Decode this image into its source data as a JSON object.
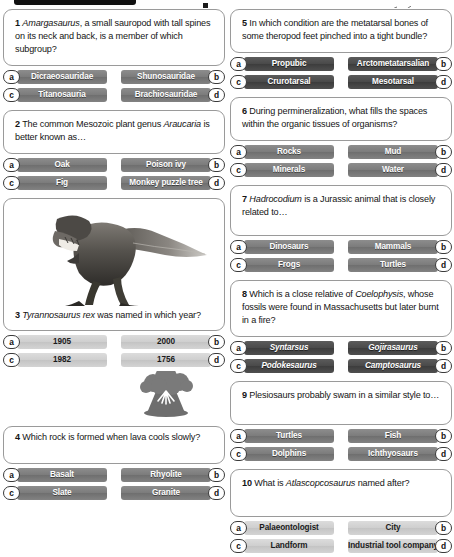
{
  "page": {
    "columns": 2
  },
  "header": {
    "bar_icon": "black-tab-bar",
    "dot_icon": "square-dot",
    "swoosh_icon": "swoosh-mark"
  },
  "shades": {
    "dark": "#4a4a4a",
    "mid": "#7c7c7c",
    "light": "#cfcfcf",
    "card_border": "#9a9a9a",
    "text": "#141414"
  },
  "letters": [
    "a",
    "b",
    "c",
    "d"
  ],
  "questions": [
    {
      "number": "1",
      "column": "left",
      "shade": "mid",
      "italic_answers": false,
      "text_parts": [
        {
          "text": "Amargasaurus",
          "italic": true
        },
        {
          "text": ", a small sauropod with tall spines on its neck and back, is a member of which subgroup?",
          "italic": false
        }
      ],
      "answers": [
        "Dicraeosauridae",
        "Shunosauridae",
        "Titanosauria",
        "Brachiosauridae"
      ]
    },
    {
      "number": "2",
      "column": "left",
      "shade": "mid",
      "italic_answers": false,
      "text_parts": [
        {
          "text": "The common Mesozoic plant genus ",
          "italic": false
        },
        {
          "text": "Araucaria",
          "italic": true
        },
        {
          "text": " is better known as…",
          "italic": false
        }
      ],
      "answers": [
        "Oak",
        "Poison ivy",
        "Fig",
        "Monkey puzzle tree"
      ]
    },
    {
      "number": "3",
      "column": "left",
      "shade": "light",
      "italic_answers": false,
      "image": "tyrannosaurus-rex-photo",
      "text_parts": [
        {
          "text": "Tyrannosaurus rex",
          "italic": true
        },
        {
          "text": " was named in which year?",
          "italic": false
        }
      ],
      "answers": [
        "1905",
        "2000",
        "1982",
        "1756"
      ]
    },
    {
      "number": "4",
      "column": "left",
      "shade": "mid",
      "italic_answers": false,
      "image": "erupting-volcano-illustration",
      "text_parts": [
        {
          "text": "Which rock is formed when lava cools slowly?",
          "italic": false
        }
      ],
      "answers": [
        "Basalt",
        "Rhyolite",
        "Slate",
        "Granite"
      ]
    },
    {
      "number": "5",
      "column": "right",
      "shade": "dark",
      "italic_answers": false,
      "text_parts": [
        {
          "text": "In which condition are the metatarsal bones of some theropod feet pinched into a tight bundle?",
          "italic": false
        }
      ],
      "answers": [
        "Propubic",
        "Arctometatarsalian",
        "Crurotarsal",
        "Mesotarsal"
      ]
    },
    {
      "number": "6",
      "column": "right",
      "shade": "mid",
      "italic_answers": false,
      "text_parts": [
        {
          "text": "During permineralization, what fills the spaces within the organic tissues of organisms?",
          "italic": false
        }
      ],
      "answers": [
        "Rocks",
        "Mud",
        "Minerals",
        "Water"
      ]
    },
    {
      "number": "7",
      "column": "right",
      "shade": "mid",
      "italic_answers": false,
      "text_parts": [
        {
          "text": "Hadrocodium",
          "italic": true
        },
        {
          "text": " is a Jurassic animal that is closely related to…",
          "italic": false
        }
      ],
      "answers": [
        "Dinosaurs",
        "Mammals",
        "Frogs",
        "Turtles"
      ]
    },
    {
      "number": "8",
      "column": "right",
      "shade": "dark",
      "italic_answers": true,
      "text_parts": [
        {
          "text": "Which is a close relative of ",
          "italic": false
        },
        {
          "text": "Coelophysis",
          "italic": true
        },
        {
          "text": ", whose fossils were found in Massachusetts but later burnt in a fire?",
          "italic": false
        }
      ],
      "answers": [
        "Syntarsus",
        "Gojirasaurus",
        "Podokesaurus",
        "Camptosaurus"
      ]
    },
    {
      "number": "9",
      "column": "right",
      "shade": "mid",
      "italic_answers": false,
      "text_parts": [
        {
          "text": "Plesiosaurs probably swam in a similar style to…",
          "italic": false
        }
      ],
      "answers": [
        "Turtles",
        "Fish",
        "Dolphins",
        "Ichthyosaurs"
      ]
    },
    {
      "number": "10",
      "column": "right",
      "shade": "light",
      "italic_answers": false,
      "text_parts": [
        {
          "text": "What is ",
          "italic": false
        },
        {
          "text": "Atlascopcosaurus",
          "italic": true
        },
        {
          "text": " named after?",
          "italic": false
        }
      ],
      "answers": [
        "Palaeontologist",
        "City",
        "Landform",
        "Industrial tool company"
      ]
    }
  ]
}
